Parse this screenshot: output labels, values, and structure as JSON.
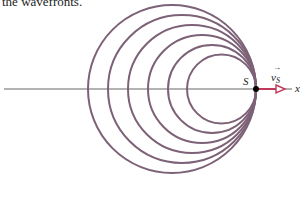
{
  "caption": "the wavefronts.",
  "diagram": {
    "source_label": "S",
    "velocity_label": "v",
    "velocity_subscript": "S",
    "axis_label": "x",
    "colors": {
      "wavefront": "#7d6277",
      "axis": "#555555",
      "velocity_arrow": "#c0395a",
      "source_dot": "#000000"
    },
    "source_point": {
      "x": 256,
      "y": 89
    },
    "wavefront_radii": [
      84,
      74,
      64,
      54,
      44,
      34.5
    ]
  }
}
